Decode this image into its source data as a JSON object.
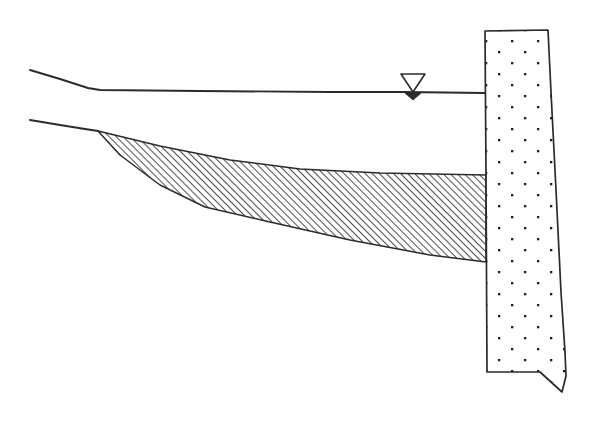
{
  "figure": {
    "caption": "",
    "background_color": "#ffffff",
    "line_color": "#2b2b2b",
    "width": 591,
    "height": 432
  },
  "elements": {
    "wall": {
      "label": "Concrete retaining wall",
      "material": "concrete",
      "fill_pattern": "stipple-dots",
      "fill_color": "#ffffff",
      "dot_color": "#1d1d1d",
      "outline_color": "#2b2b2b",
      "outline_width": 1.6,
      "points": "485,31 548,30 551,92 556,190 561,292 565,352 566,376 562,392 540,372 487,372 486,175 485,31",
      "top_elevation_y": 30,
      "base_tip_y": 392
    },
    "failure_wedge": {
      "label": "Active soil failure wedge",
      "fill_pattern": "diagonal-hatch",
      "hatch_color": "#2b2b2b",
      "hatch_angle_deg": 45,
      "hatch_spacing_px": 5,
      "outline_color": "#2b2b2b",
      "outline_width": 1.4,
      "points": "98,131 160,146 230,160 300,169 380,173 486,175 486,262 430,255 350,240 270,222 205,207 160,185 120,155 98,131",
      "tip_x": 98,
      "tip_y": 131
    },
    "ground_surface_upper": {
      "label": "Upper ground surface line",
      "points": "30,70 60,79 88,88 100,90 200,91 330,92 404,92 485,93",
      "stroke_width": 1.8
    },
    "ground_surface_lower": {
      "label": "Lower ground / backfill surface line",
      "points": "30,120 60,125 85,129 98,131",
      "stroke_width": 1.8
    },
    "water_table": {
      "label": "Groundwater table symbol",
      "symbol": "inverted-triangle",
      "apex_x": 413,
      "line_y": 92,
      "open_triangle": "401,74 425,74 413,92",
      "filled_triangle": "405,93 421,93 413,100",
      "stroke_color": "#2b2b2b",
      "fill_color": "#2b2b2b"
    }
  },
  "chart_data": {
    "type": "diagram",
    "annotations": [
      "Concrete retaining wall (stippled)",
      "Active failure wedge (hatched)",
      "Ground surface",
      "Groundwater table"
    ]
  }
}
